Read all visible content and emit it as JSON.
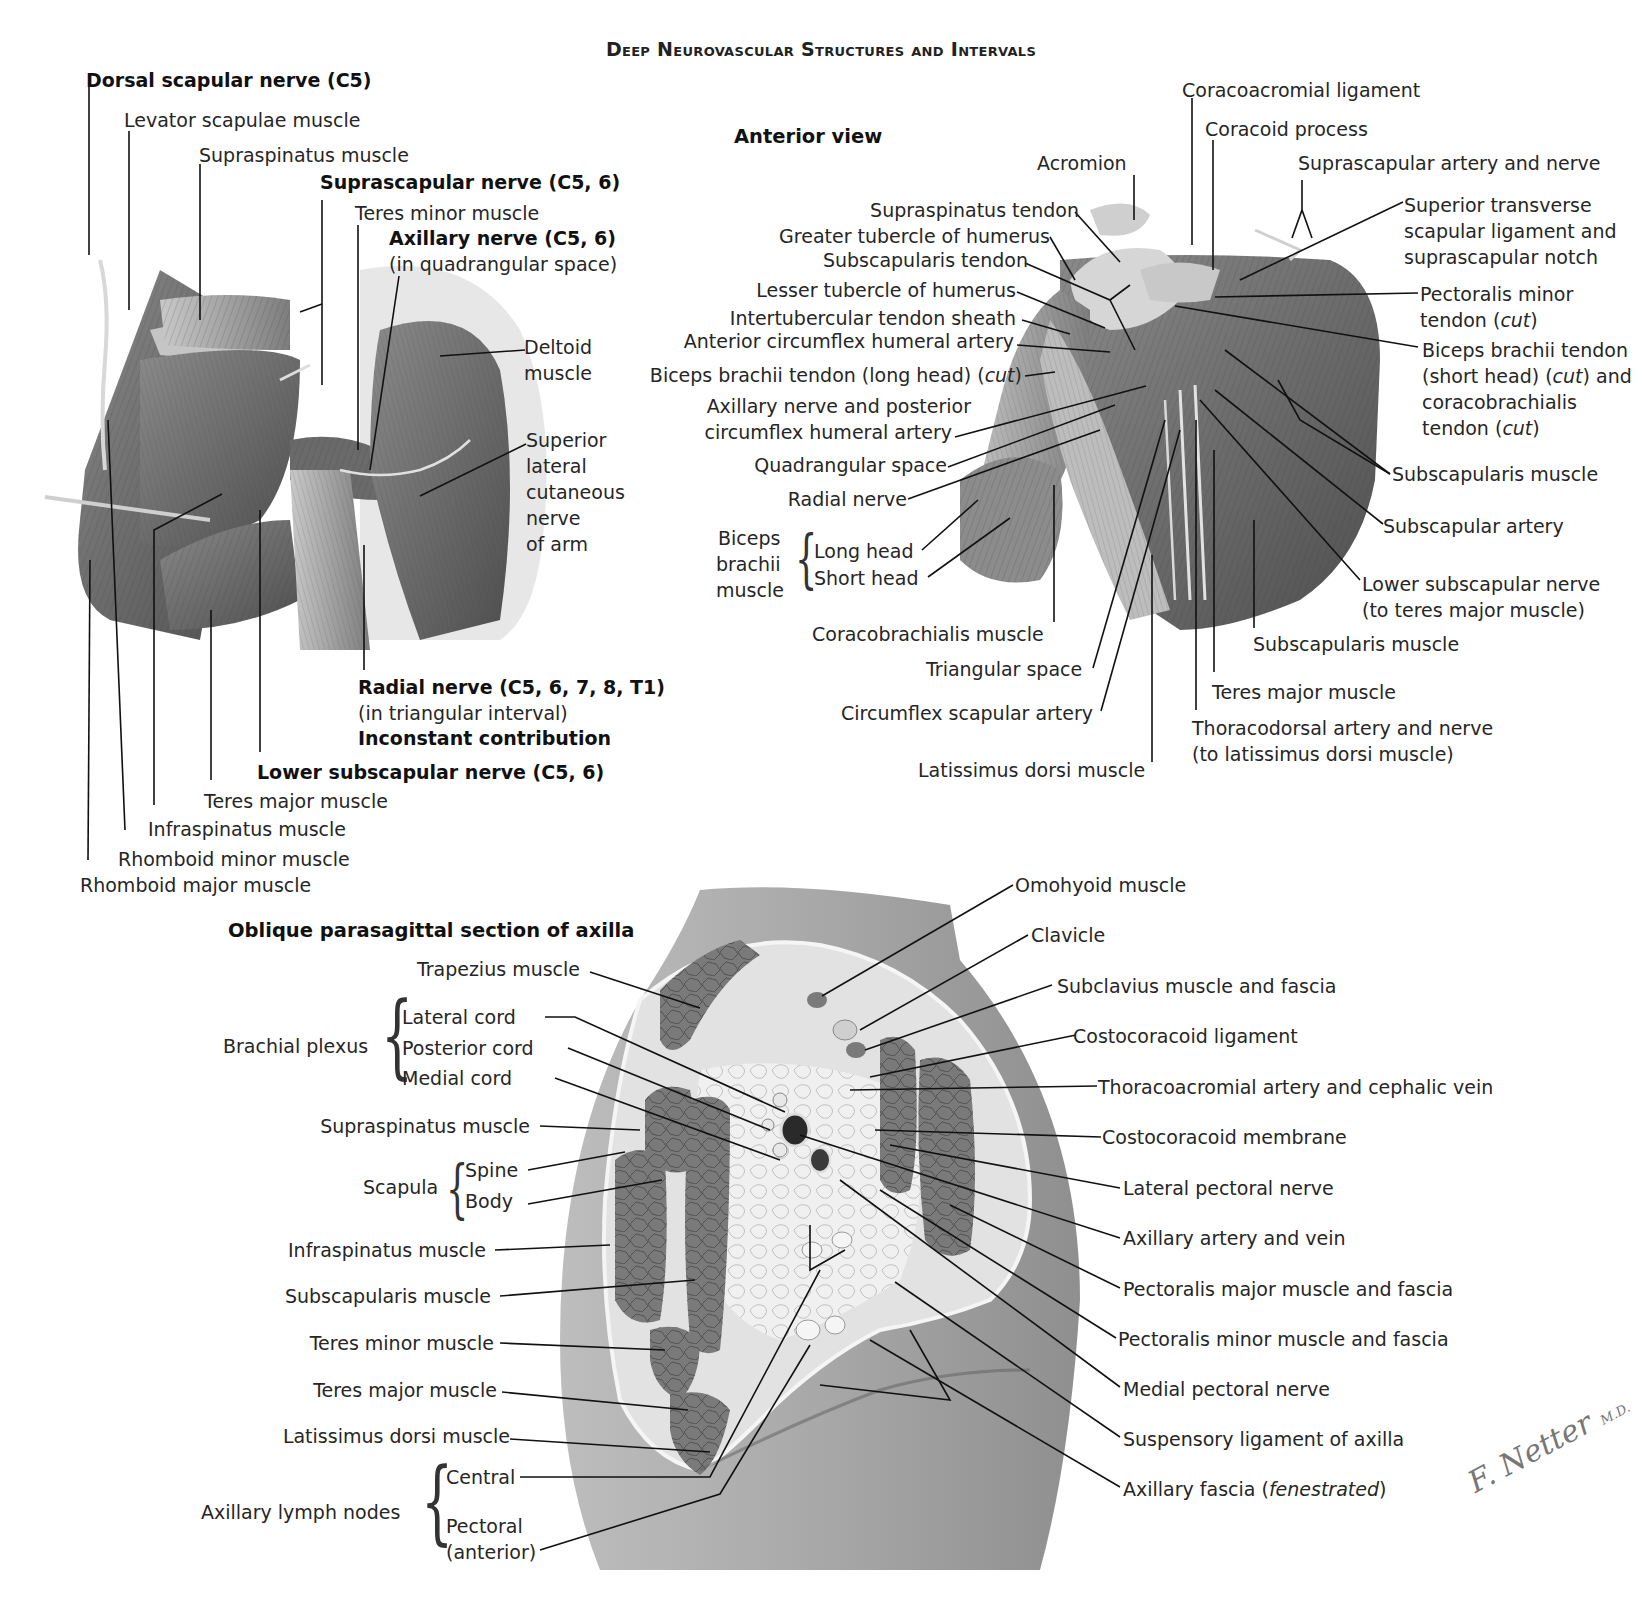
{
  "page": {
    "title": "Deep Neurovascular Structures and Intervals"
  },
  "posterior_view": {
    "labels": {
      "dorsal_scapular_nerve": "Dorsal scapular nerve (C5)",
      "levator_scapulae": "Levator scapulae muscle",
      "supraspinatus": "Supraspinatus muscle",
      "suprascapular_nerve": "Suprascapular nerve (C5, 6)",
      "teres_minor": "Teres minor muscle",
      "axillary_nerve": "Axillary nerve (C5, 6)",
      "axillary_nerve_note": "(in quadrangular space)",
      "deltoid_1": "Deltoid",
      "deltoid_2": "muscle",
      "slcn_1": "Superior",
      "slcn_2": "lateral",
      "slcn_3": "cutaneous",
      "slcn_4": "nerve",
      "slcn_5": "of arm",
      "radial_nerve": "Radial nerve (C5, 6, 7, 8, T1)",
      "radial_nerve_note": "(in triangular interval)",
      "inconstant": "Inconstant contribution",
      "lower_subscapular_nerve": "Lower subscapular nerve (C5, 6)",
      "teres_major": "Teres major muscle",
      "infraspinatus": "Infraspinatus muscle",
      "rhomboid_minor": "Rhomboid minor muscle",
      "rhomboid_major": "Rhomboid major muscle"
    }
  },
  "anterior_view": {
    "subtitle": "Anterior view",
    "labels": {
      "coracoacromial_ligament": "Coracoacromial ligament",
      "coracoid_process": "Coracoid process",
      "acromion": "Acromion",
      "suprascapular_artery_nerve": "Suprascapular artery and nerve",
      "supraspinatus_tendon": "Supraspinatus tendon",
      "greater_tubercle": "Greater tubercle of humerus",
      "subscapularis_tendon": "Subscapularis tendon",
      "lesser_tubercle": "Lesser tubercle of humerus",
      "intertubercular_sheath": "Intertubercular tendon sheath",
      "anterior_circumflex": "Anterior circumflex humeral artery",
      "biceps_long_tendon_prefix": "Biceps brachii tendon (long head) (",
      "biceps_long_tendon_cut": "cut",
      "biceps_long_tendon_suffix": ")",
      "axillary_posterior_1": "Axillary nerve and posterior",
      "axillary_posterior_2": "circumflex humeral artery",
      "quadrangular_space": "Quadrangular space",
      "radial_nerve": "Radial nerve",
      "biceps_group_1": "Biceps",
      "biceps_group_2": "brachii",
      "biceps_group_3": "muscle",
      "long_head": "Long head",
      "short_head": "Short head",
      "coracobrachialis": "Coracobrachialis muscle",
      "triangular_space": "Triangular space",
      "circumflex_scapular": "Circumflex scapular artery",
      "latissimus_dorsi": "Latissimus dorsi muscle",
      "sup_transverse_1": "Superior transverse",
      "sup_transverse_2": "scapular ligament and",
      "sup_transverse_3": "suprascapular notch",
      "pec_minor_1": "Pectoralis minor",
      "pec_minor_2_prefix": "tendon (",
      "pec_minor_2_cut": "cut",
      "pec_minor_2_suffix": ")",
      "biceps_short_1": "Biceps brachii tendon",
      "biceps_short_2_prefix": "(short head) (",
      "biceps_short_2_cut": "cut",
      "biceps_short_2_suffix": ") and",
      "biceps_short_3": "coracobrachialis",
      "biceps_short_4_prefix": "tendon (",
      "biceps_short_4_cut": "cut",
      "biceps_short_4_suffix": ")",
      "subscapularis_muscle_upper": "Subscapularis muscle",
      "subscapular_artery": "Subscapular artery",
      "lower_subscapular_1": "Lower subscapular nerve",
      "lower_subscapular_2": "(to teres major muscle)",
      "subscapularis_muscle_lower": "Subscapularis muscle",
      "teres_major": "Teres major muscle",
      "thoracodorsal_1": "Thoracodorsal artery and nerve",
      "thoracodorsal_2": "(to latissimus dorsi muscle)"
    }
  },
  "axilla_section": {
    "subtitle": "Oblique parasagittal section of axilla",
    "left_labels": {
      "trapezius": "Trapezius muscle",
      "brachial_plexus": "Brachial plexus",
      "lateral_cord": "Lateral cord",
      "posterior_cord": "Posterior cord",
      "medial_cord": "Medial cord",
      "supraspinatus": "Supraspinatus muscle",
      "scapula": "Scapula",
      "spine": "Spine",
      "body": "Body",
      "infraspinatus": "Infraspinatus muscle",
      "subscapularis": "Subscapularis muscle",
      "teres_minor": "Teres minor muscle",
      "teres_major": "Teres major muscle",
      "latissimus_dorsi": "Latissimus dorsi muscle",
      "lymph_nodes": "Axillary lymph nodes",
      "central": "Central",
      "pectoral_1": "Pectoral",
      "pectoral_2": "(anterior)"
    },
    "right_labels": {
      "omohyoid": "Omohyoid muscle",
      "clavicle": "Clavicle",
      "subclavius": "Subclavius muscle and fascia",
      "costocoracoid_ligament": "Costocoracoid ligament",
      "thoracoacromial": "Thoracoacromial artery and cephalic vein",
      "costocoracoid_membrane": "Costocoracoid membrane",
      "lateral_pectoral_nerve": "Lateral pectoral nerve",
      "axillary_artery_vein": "Axillary artery and vein",
      "pec_major": "Pectoralis major muscle and fascia",
      "pec_minor": "Pectoralis minor muscle and fascia",
      "medial_pectoral_nerve": "Medial pectoral nerve",
      "suspensory_ligament": "Suspensory ligament of axilla",
      "axillary_fascia_prefix": "Axillary fascia (",
      "axillary_fascia_italic": "fenestrated",
      "axillary_fascia_suffix": ")"
    }
  },
  "signature": {
    "name": "F. Netter",
    "suffix": "M.D."
  },
  "colors": {
    "muscle_dark": "#6e6e6e",
    "muscle_mid": "#9a9a9a",
    "tissue_light": "#d9d9d9",
    "fat": "#ececec",
    "leader": "#111111"
  }
}
